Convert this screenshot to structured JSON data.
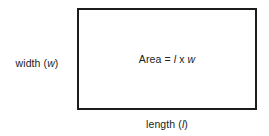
{
  "figure": {
    "type": "geometry-diagram",
    "background_color": "#ffffff",
    "stroke_color": "#1c1c1c",
    "text_color": "#222222"
  },
  "shape": {
    "name": "rectangle",
    "border_width_px": 2,
    "x_px": 77,
    "y_px": 8,
    "width_px": 180,
    "height_px": 102
  },
  "labels": {
    "width": {
      "full": "width (w)",
      "text": "width",
      "open_paren": "(",
      "variable": "w",
      "close_paren": ")"
    },
    "length": {
      "full": "length (l)",
      "text": "length",
      "open_paren": "(",
      "variable": "l",
      "close_paren": ")"
    },
    "area": {
      "full": "Area = l x w",
      "text": "Area",
      "equals": "=",
      "variable_length": "l",
      "operator": "x",
      "variable_width": "w"
    }
  }
}
